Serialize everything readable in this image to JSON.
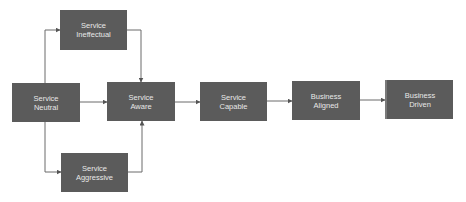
{
  "diagram": {
    "type": "flowchart",
    "colors": {
      "node_fill": "#5b5b5b",
      "node_text": "#e8e8e8",
      "edge": "#6a6a6a",
      "background": "#ffffff"
    },
    "nodes": {
      "ineffectual": {
        "line1": "Service",
        "line2": "Ineffectual"
      },
      "neutral": {
        "line1": "Service",
        "line2": "Neutral"
      },
      "aware": {
        "line1": "Service",
        "line2": "Aware"
      },
      "aggressive": {
        "line1": "Service",
        "line2": "Aggressive"
      },
      "capable": {
        "line1": "Service",
        "line2": "Capable"
      },
      "aligned": {
        "line1": "Business",
        "line2": "Aligned"
      },
      "driven": {
        "line1": "Business",
        "line2": "Driven"
      }
    },
    "edges": [
      {
        "from": "neutral",
        "to": "ineffectual"
      },
      {
        "from": "neutral",
        "to": "aware"
      },
      {
        "from": "neutral",
        "to": "aggressive"
      },
      {
        "from": "ineffectual",
        "to": "aware"
      },
      {
        "from": "aggressive",
        "to": "aware"
      },
      {
        "from": "aware",
        "to": "capable"
      },
      {
        "from": "capable",
        "to": "aligned"
      },
      {
        "from": "aligned",
        "to": "driven"
      }
    ]
  }
}
